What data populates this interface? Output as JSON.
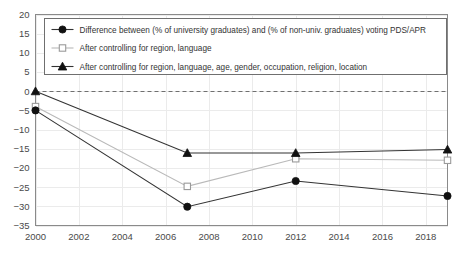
{
  "chart_data": {
    "type": "line",
    "title": "",
    "subtitle": "",
    "xlabel": "",
    "ylabel": "",
    "x": [
      2000,
      2007,
      2012,
      2019
    ],
    "xlim": [
      2000,
      2019
    ],
    "ylim": [
      -35,
      20
    ],
    "grid": true,
    "legend_position": "top-left-inside",
    "y_ticks": [
      20,
      15,
      10,
      5,
      0,
      -5,
      -10,
      -15,
      -20,
      -25,
      -30,
      -35
    ],
    "y_tick_labels": [
      "20",
      "15",
      "10",
      "5",
      "0",
      "−5",
      "−10",
      "−15",
      "−20",
      "−25",
      "−30",
      "−35"
    ],
    "x_ticks": [
      2000,
      2002,
      2004,
      2006,
      2008,
      2010,
      2012,
      2014,
      2016,
      2018
    ],
    "x_tick_labels": [
      "2000",
      "2002",
      "2004",
      "2006",
      "2008",
      "2010",
      "2012",
      "2014",
      "2016",
      "2018"
    ],
    "reference_lines": [
      {
        "axis": "y",
        "value": 0,
        "style": "dashed",
        "color": "#6f6f6f"
      }
    ],
    "series": [
      {
        "name": "Difference between (% of university graduates) and (% of non-univ. graduates) voting PDS/APR",
        "marker": "filled-circle",
        "color": "#333333",
        "values": [
          -5.0,
          -30.1,
          -23.4,
          -27.3
        ]
      },
      {
        "name": "After controlling for region, language",
        "marker": "open-square",
        "color": "#b9b9b9",
        "values": [
          -4.0,
          -24.8,
          -17.6,
          -18.0
        ]
      },
      {
        "name": "After controlling for region, language, age, gender, occupation, religion, location",
        "marker": "filled-triangle",
        "color": "#333333",
        "values": [
          0.0,
          -16.1,
          -16.1,
          -15.2
        ]
      }
    ]
  },
  "legend": {
    "items": [
      {
        "label": "Difference between (% of university graduates) and (% of non-univ. graduates) voting PDS/APR",
        "marker": "filled-circle"
      },
      {
        "label": "After controlling for region, language",
        "marker": "open-square"
      },
      {
        "label": "After controlling for region, language, age, gender, occupation, religion, location",
        "marker": "filled-triangle"
      }
    ]
  }
}
